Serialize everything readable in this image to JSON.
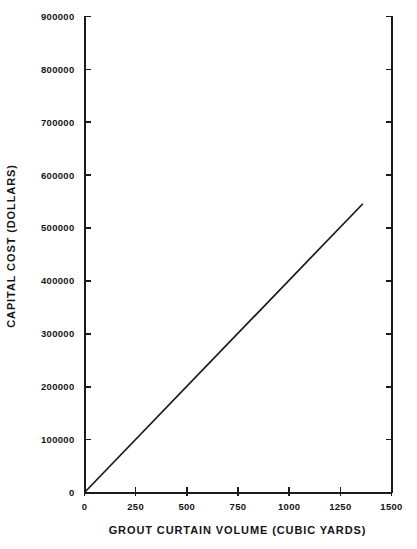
{
  "chart_data": {
    "type": "line",
    "title": "",
    "xlabel": "GROUT CURTAIN VOLUME (CUBIC YARDS)",
    "ylabel": "CAPITAL COST (DOLLARS)",
    "xlim": [
      0,
      1500
    ],
    "ylim": [
      0,
      900000
    ],
    "xticks": [
      0,
      250,
      500,
      750,
      1000,
      1250,
      1500
    ],
    "xtick_labels": [
      "0",
      "250",
      "500",
      "750",
      "1000",
      "1250",
      "1500"
    ],
    "yticks": [
      0,
      100000,
      200000,
      300000,
      400000,
      500000,
      600000,
      700000,
      800000,
      900000
    ],
    "ytick_labels": [
      "0",
      "100000",
      "200000",
      "300000",
      "400000",
      "500000",
      "600000",
      "700000",
      "800000",
      "900000"
    ],
    "grid": false,
    "legend": "none",
    "series": [
      {
        "name": "capital cost",
        "color": "#1a1a1a",
        "x": [
          0,
          1360
        ],
        "y": [
          0,
          546000
        ]
      }
    ],
    "annotations": []
  },
  "axes": {
    "left_spine": true,
    "right_spine": true,
    "bottom_spine": true,
    "top_spine": false,
    "tick_direction": "in"
  }
}
